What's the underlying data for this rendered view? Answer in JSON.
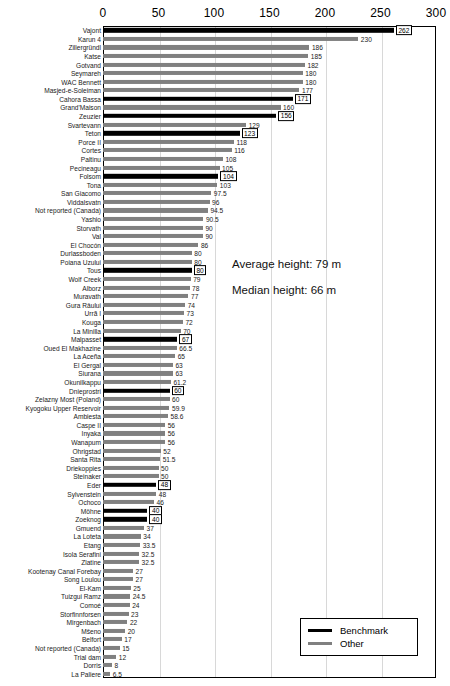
{
  "chart_data": {
    "type": "bar",
    "orientation": "horizontal",
    "title": "",
    "subtitle": "",
    "xlabel": "",
    "ylabel": "",
    "xlim": [
      0,
      300
    ],
    "xticks": [
      0,
      50,
      100,
      150,
      200,
      250,
      300
    ],
    "grid": true,
    "legend_position": "bottom-right",
    "series": [
      {
        "name": "Benchmark",
        "color": "#000000"
      },
      {
        "name": "Other",
        "color": "#808080"
      }
    ],
    "categories": [
      "Vajont",
      "Karun 4",
      "Zillergründl",
      "Katse",
      "Gotvand",
      "Seymareh",
      "WAC Bennett",
      "Masjed-e-Soleiman",
      "Cahora Bassa",
      "Grand'Maison",
      "Zeuzier",
      "Svartevann",
      "Teton",
      "Porce II",
      "Cortes",
      "Paltinu",
      "Pecineagu",
      "Folsom",
      "Tona",
      "San Giacomo",
      "Viddalsvatn",
      "Not reported (Canada)",
      "Yashio",
      "Storvath",
      "Val",
      "El Chocón",
      "Durlassboden",
      "Poiana Uzului",
      "Tous",
      "Wolf Creek",
      "Alborz",
      "Muravath",
      "Gura Râului",
      "Urrã I",
      "Kouga",
      "La Minilla",
      "Malpasset",
      "Oued El Makhazine",
      "La Aceña",
      "El Gergal",
      "Siurana",
      "Okunilkappu",
      "Dnieprostri",
      "Zelazny Most (Poland)",
      "Kyogoku Upper Reservoir",
      "Ambiesta",
      "Caspe II",
      "Inyaka",
      "Wanapum",
      "Ohrigstad",
      "Santa Rita",
      "Driekoppies",
      "Steinaker",
      "Eder",
      "Sylvenstein",
      "Ochoco",
      "Möhne",
      "Zoeknog",
      "Gmuend",
      "La Loteta",
      "Etang",
      "Isola Serafini",
      "Zlatine",
      "Kootenay Canal Forebay",
      "Song Loulou",
      "El-Kam",
      "Tuizgui Ramz",
      "Comoé",
      "Storfinnforsen",
      "Mirgenbach",
      "Mšeno",
      "Belfort",
      "Not reported (Canada)",
      "Trial dam",
      "Dorris",
      "La Paliere"
    ],
    "values": [
      262,
      230,
      186,
      185,
      182,
      180,
      180,
      177,
      171,
      160,
      156,
      129,
      123,
      118,
      116,
      108,
      105,
      104,
      103,
      97.5,
      96,
      94.5,
      90.5,
      90,
      90,
      86,
      80,
      80,
      80,
      79,
      78,
      77,
      74,
      73,
      72,
      70,
      67,
      66.5,
      65,
      63,
      63,
      61.2,
      60,
      60,
      59.9,
      58.6,
      56,
      56,
      56,
      52,
      51.5,
      50,
      50,
      48,
      48,
      46,
      40,
      40,
      37,
      34,
      33.5,
      32.5,
      32.5,
      27,
      27,
      25,
      24.5,
      24,
      23,
      22,
      20,
      17,
      15,
      12,
      8,
      6.5
    ],
    "value_labels": [
      "262",
      "230",
      "186",
      "185",
      "182",
      "180",
      "180",
      "177",
      "171",
      "160",
      "156",
      "129",
      "123",
      "118",
      "116",
      "108",
      "105",
      "104",
      "103",
      "97.5",
      "96",
      "94.5",
      "90.5",
      "90",
      "90",
      "86",
      "80",
      "80",
      "80",
      "79",
      "78",
      "77",
      "74",
      "73",
      "72",
      "70",
      "67",
      "66.5",
      "65",
      "63",
      "63",
      "61.2",
      "60",
      "60",
      "59.9",
      "58.6",
      "56",
      "56",
      "56",
      "52",
      "51.5",
      "50",
      "50",
      "48",
      "48",
      "46",
      "40",
      "40",
      "37",
      "34",
      "33.5",
      "32.5",
      "32.5",
      "27",
      "27",
      "25",
      "24.5",
      "24",
      "23",
      "22",
      "20",
      "17",
      "15",
      "12",
      "8",
      "6.5"
    ],
    "group": [
      "Benchmark",
      "Other",
      "Other",
      "Other",
      "Other",
      "Other",
      "Other",
      "Other",
      "Benchmark",
      "Other",
      "Benchmark",
      "Other",
      "Benchmark",
      "Other",
      "Other",
      "Other",
      "Other",
      "Benchmark",
      "Other",
      "Other",
      "Other",
      "Other",
      "Other",
      "Other",
      "Other",
      "Other",
      "Other",
      "Other",
      "Benchmark",
      "Other",
      "Other",
      "Other",
      "Other",
      "Other",
      "Other",
      "Other",
      "Benchmark",
      "Other",
      "Other",
      "Other",
      "Other",
      "Other",
      "Benchmark",
      "Other",
      "Other",
      "Other",
      "Other",
      "Other",
      "Other",
      "Other",
      "Other",
      "Other",
      "Other",
      "Benchmark",
      "Other",
      "Other",
      "Benchmark",
      "Benchmark",
      "Other",
      "Other",
      "Other",
      "Other",
      "Other",
      "Other",
      "Other",
      "Other",
      "Other",
      "Other",
      "Other",
      "Other",
      "Other",
      "Other",
      "Other",
      "Other",
      "Other",
      "Other"
    ],
    "annotations": [
      "Average height: 79 m",
      "Median height: 66 m"
    ]
  },
  "legend": {
    "items": [
      {
        "label": "Benchmark",
        "color": "#000000"
      },
      {
        "label": "Other",
        "color": "#808080"
      }
    ]
  }
}
